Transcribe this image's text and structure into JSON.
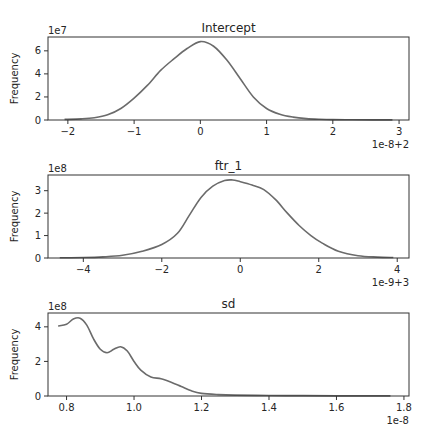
{
  "chart_data": [
    {
      "type": "line",
      "title": "Intercept",
      "xlabel": "",
      "ylabel": "Frequency",
      "y_scale_label": "1e7",
      "x_offset_label": "1e-8+2",
      "xlim": [
        -2.3,
        3.15
      ],
      "ylim": [
        0,
        7.2
      ],
      "xticks": [
        "−2",
        "−1",
        "0",
        "1",
        "2",
        "3"
      ],
      "xtick_values": [
        -2,
        -1,
        0,
        1,
        2,
        3
      ],
      "yticks": [
        "0",
        "2",
        "4",
        "6"
      ],
      "ytick_values": [
        0,
        2,
        4,
        6
      ],
      "grid": false,
      "x": [
        -2.05,
        -1.8,
        -1.6,
        -1.4,
        -1.2,
        -1.0,
        -0.8,
        -0.6,
        -0.4,
        -0.2,
        0.0,
        0.2,
        0.4,
        0.6,
        0.8,
        1.0,
        1.2,
        1.4,
        1.6,
        1.8,
        2.0,
        2.3,
        2.6,
        2.9
      ],
      "y": [
        0.05,
        0.1,
        0.2,
        0.45,
        1.0,
        1.9,
        3.0,
        4.3,
        5.3,
        6.2,
        6.8,
        6.4,
        5.2,
        3.6,
        2.0,
        1.0,
        0.5,
        0.25,
        0.12,
        0.06,
        0.03,
        0.02,
        0.01,
        0.01
      ]
    },
    {
      "type": "line",
      "title": "ftr_1",
      "xlabel": "",
      "ylabel": "Frequency",
      "y_scale_label": "1e8",
      "x_offset_label": "1e-9+3",
      "xlim": [
        -4.9,
        4.3
      ],
      "ylim": [
        0,
        3.7
      ],
      "xticks": [
        "−4",
        "−2",
        "0",
        "2",
        "4"
      ],
      "xtick_values": [
        -4,
        -2,
        0,
        2,
        4
      ],
      "yticks": [
        "0",
        "1",
        "2",
        "3"
      ],
      "ytick_values": [
        0,
        1,
        2,
        3
      ],
      "grid": false,
      "x": [
        -4.6,
        -4.0,
        -3.5,
        -3.0,
        -2.5,
        -2.0,
        -1.6,
        -1.3,
        -1.0,
        -0.7,
        -0.4,
        -0.2,
        0.0,
        0.3,
        0.6,
        0.9,
        1.2,
        1.5,
        1.8,
        2.1,
        2.5,
        3.0,
        3.5,
        3.9
      ],
      "y": [
        0.01,
        0.02,
        0.05,
        0.12,
        0.3,
        0.6,
        1.1,
        1.9,
        2.7,
        3.2,
        3.45,
        3.48,
        3.4,
        3.25,
        3.05,
        2.6,
        2.0,
        1.45,
        1.0,
        0.65,
        0.3,
        0.1,
        0.04,
        0.02
      ]
    },
    {
      "type": "line",
      "title": "sd",
      "xlabel": "",
      "ylabel": "Frequency",
      "y_scale_label": "1e8",
      "x_offset_label": "1e-8",
      "xlim": [
        0.745,
        1.815
      ],
      "ylim": [
        0,
        4.8
      ],
      "xticks": [
        "0.8",
        "1.0",
        "1.2",
        "1.4",
        "1.6",
        "1.8"
      ],
      "xtick_values": [
        0.8,
        1.0,
        1.2,
        1.4,
        1.6,
        1.8
      ],
      "yticks": [
        "0",
        "2",
        "4"
      ],
      "ytick_values": [
        0,
        2,
        4
      ],
      "grid": false,
      "x": [
        0.775,
        0.8,
        0.82,
        0.84,
        0.86,
        0.88,
        0.9,
        0.92,
        0.94,
        0.96,
        0.98,
        1.0,
        1.02,
        1.05,
        1.08,
        1.11,
        1.14,
        1.17,
        1.2,
        1.25,
        1.3,
        1.4,
        1.5,
        1.6,
        1.7,
        1.76
      ],
      "y": [
        4.05,
        4.15,
        4.45,
        4.5,
        4.1,
        3.3,
        2.7,
        2.5,
        2.7,
        2.85,
        2.6,
        2.0,
        1.5,
        1.1,
        1.0,
        0.8,
        0.55,
        0.3,
        0.15,
        0.08,
        0.05,
        0.03,
        0.02,
        0.01,
        0.01,
        0.01
      ]
    }
  ]
}
